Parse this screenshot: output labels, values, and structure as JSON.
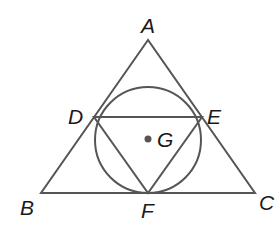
{
  "caption_fragment": "… is equilateral.",
  "diagram": {
    "stroke_color": "#555555",
    "dot_color": "#555555",
    "outer_triangle": [
      "A",
      "B",
      "C"
    ],
    "inner_triangle": [
      "D",
      "E",
      "F"
    ],
    "circle": "circumscribes DEF, inscribed in ABC",
    "center_point": "G",
    "labels": {
      "A": "A",
      "B": "B",
      "C": "C",
      "D": "D",
      "E": "E",
      "F": "F",
      "G": "G"
    }
  }
}
